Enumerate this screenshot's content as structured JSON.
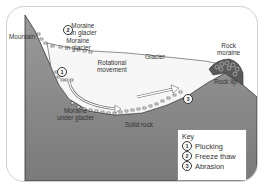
{
  "diagram": {
    "labels": {
      "moraine_on_glacier": [
        "Moraine",
        "on glacier"
      ],
      "mountain": "Mountain",
      "moraine_in_glacier": [
        "Moraine",
        "in glacier"
      ],
      "rotational_movement": [
        "Rotational",
        "movement"
      ],
      "glacier": "Glacier",
      "rock_moraine": [
        "Rock",
        "moraine"
      ],
      "rock_lip": "Rock lip",
      "moraine_under_glacier": [
        "Moraine",
        "under glacier"
      ],
      "solid_rock": "Solid rock"
    },
    "markers": [
      {
        "number": "1",
        "process": "Plucking"
      },
      {
        "number": "2",
        "process": "Freeze thaw"
      },
      {
        "number": "3",
        "process": "Abrasion"
      }
    ],
    "key": {
      "title": "Key",
      "items": [
        {
          "number": "1",
          "label": "Plucking"
        },
        {
          "number": "2",
          "label": "Freeze thaw"
        },
        {
          "number": "3",
          "label": "Abrasion"
        }
      ]
    },
    "colors": {
      "rock": "#8c8c8c",
      "rock_dark": "#6f6f6f",
      "glacier": "#f7f7f7",
      "outline": "#333333",
      "card_border": "#cfcfcf"
    }
  }
}
